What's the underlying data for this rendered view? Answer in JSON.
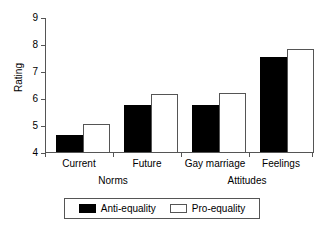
{
  "chart_data": {
    "type": "bar",
    "title": "",
    "xlabel": "",
    "ylabel": "Rating",
    "ylim": [
      4,
      9
    ],
    "yticks": [
      4,
      5,
      6,
      7,
      8,
      9
    ],
    "ytick_labels": [
      "4",
      "5",
      "6",
      "7",
      "8",
      "9"
    ],
    "grid": false,
    "legend_position": "bottom",
    "categories": [
      "Current",
      "Future",
      "Gay marriage",
      "Feelings"
    ],
    "groups": [
      {
        "name": "Norms",
        "categories": [
          "Current",
          "Future"
        ]
      },
      {
        "name": "Attitudes",
        "categories": [
          "Gay marriage",
          "Feelings"
        ]
      }
    ],
    "series": [
      {
        "name": "Anti-equality",
        "color": "#000000",
        "values": [
          4.68,
          5.78,
          5.76,
          7.55
        ]
      },
      {
        "name": "Pro-equality",
        "color": "#ffffff",
        "values": [
          5.08,
          6.18,
          6.21,
          7.84
        ]
      }
    ]
  },
  "axis": {
    "y_label": "Rating",
    "y_ticks": [
      "9",
      "8",
      "7",
      "6",
      "5",
      "4"
    ]
  },
  "categories": [
    {
      "label": "Current"
    },
    {
      "label": "Future"
    },
    {
      "label": "Gay marriage"
    },
    {
      "label": "Feelings"
    }
  ],
  "groups": [
    {
      "label": "Norms"
    },
    {
      "label": "Attitudes"
    }
  ],
  "legend": {
    "items": [
      {
        "label": "Anti-equality",
        "swatch": "filled-black"
      },
      {
        "label": "Pro-equality",
        "swatch": "open-white"
      }
    ]
  }
}
